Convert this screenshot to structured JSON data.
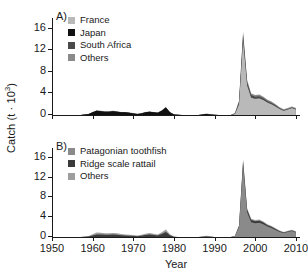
{
  "figure": {
    "xlabel": "Year",
    "ylabel_main": "Catch (t ",
    "ylabel_mid": "· 10",
    "ylabel_sup": "3",
    "ylabel_end": ")",
    "ylabel_full": "Catch (t · 10³)",
    "panel_a_letter": "A)",
    "panel_b_letter": "B)"
  },
  "colors": {
    "black": "#111111",
    "dark_gray": "#4a4a4a",
    "mid_gray": "#8a8a8a",
    "light_gray": "#b9b9b9",
    "axis": "#1a1a1a",
    "background": "#ffffff"
  },
  "panel_a": {
    "letter": "A)",
    "legend": [
      {
        "label": "France",
        "color": "#b9b9b9"
      },
      {
        "label": "Japan",
        "color": "#111111"
      },
      {
        "label": "South Africa",
        "color": "#4a4a4a"
      },
      {
        "label": "Others",
        "color": "#8a8a8a"
      }
    ],
    "yticks": [
      0,
      4,
      8,
      12,
      16
    ],
    "ylim": [
      0,
      18
    ]
  },
  "panel_b": {
    "letter": "B)",
    "legend": [
      {
        "label": "Patagonian toothfish",
        "color": "#8a8a8a"
      },
      {
        "label": "Ridge scale rattail",
        "color": "#3a3a3a"
      },
      {
        "label": "Others",
        "color": "#9e9e9e"
      }
    ],
    "yticks": [
      0,
      4,
      8,
      12,
      16
    ],
    "ylim": [
      0,
      18
    ]
  },
  "xaxis": {
    "ticks": [
      1950,
      1960,
      1970,
      1980,
      1990,
      2000,
      2010
    ],
    "xlim": [
      1950,
      2011
    ]
  },
  "chart_data": {
    "type": "area",
    "title": "",
    "xlabel": "Year",
    "ylabel": "Catch (t · 10³)",
    "xlim": [
      1950,
      2011
    ],
    "ylim": [
      0,
      18
    ],
    "grid": false,
    "panels": [
      {
        "panel": "A)",
        "legend_position": "top-left",
        "stacked": true,
        "x": [
          1950,
          1951,
          1952,
          1953,
          1954,
          1955,
          1956,
          1957,
          1958,
          1959,
          1960,
          1961,
          1962,
          1963,
          1964,
          1965,
          1966,
          1967,
          1968,
          1969,
          1970,
          1971,
          1972,
          1973,
          1974,
          1975,
          1976,
          1977,
          1978,
          1979,
          1980,
          1981,
          1982,
          1983,
          1984,
          1985,
          1986,
          1987,
          1988,
          1989,
          1990,
          1991,
          1992,
          1993,
          1994,
          1995,
          1996,
          1997,
          1998,
          1999,
          2000,
          2001,
          2002,
          2003,
          2004,
          2005,
          2006,
          2007,
          2008,
          2009,
          2010
        ],
        "series": [
          {
            "name": "France",
            "color": "#b9b9b9",
            "values": [
              0,
              0,
              0,
              0,
              0,
              0,
              0,
              0,
              0,
              0,
              0,
              0,
              0,
              0,
              0,
              0,
              0,
              0,
              0,
              0,
              0,
              0,
              0,
              0,
              0,
              0,
              0,
              0,
              0,
              0,
              0,
              0,
              0,
              0,
              0,
              0,
              0,
              0,
              0,
              0,
              0,
              0,
              0,
              0,
              0,
              0.2,
              2.0,
              14.0,
              5.5,
              3.2,
              3.0,
              3.1,
              2.8,
              2.3,
              2.0,
              1.6,
              1.1,
              0.8,
              1.0,
              1.3,
              1.0
            ]
          },
          {
            "name": "Japan",
            "color": "#111111",
            "values": [
              0,
              0,
              0,
              0,
              0,
              0,
              0,
              0,
              0.1,
              0.2,
              0.5,
              0.8,
              0.7,
              0.6,
              0.6,
              0.7,
              0.6,
              0.5,
              0.5,
              0.4,
              0.3,
              0.2,
              0.3,
              0.5,
              0.6,
              0.5,
              0.4,
              0.8,
              1.4,
              0.5,
              0.1,
              0.05,
              0,
              0,
              0,
              0,
              0,
              0.1,
              0.2,
              0.1,
              0.05,
              0,
              0,
              0,
              0,
              0,
              0,
              0,
              0,
              0,
              0,
              0,
              0,
              0,
              0,
              0,
              0,
              0,
              0,
              0,
              0
            ]
          },
          {
            "name": "South Africa",
            "color": "#4a4a4a",
            "values": [
              0,
              0,
              0,
              0,
              0,
              0,
              0,
              0,
              0,
              0,
              0,
              0,
              0,
              0,
              0,
              0,
              0,
              0,
              0,
              0,
              0,
              0,
              0,
              0,
              0,
              0,
              0,
              0,
              0,
              0,
              0,
              0,
              0,
              0,
              0,
              0,
              0,
              0,
              0,
              0,
              0,
              0,
              0,
              0,
              0,
              0.1,
              0.4,
              1.0,
              0.6,
              0.5,
              0.4,
              0.4,
              0.3,
              0.3,
              0.25,
              0.2,
              0.15,
              0.1,
              0.1,
              0.1,
              0.1
            ]
          },
          {
            "name": "Others",
            "color": "#8a8a8a",
            "values": [
              0,
              0,
              0,
              0,
              0,
              0,
              0,
              0,
              0,
              0,
              0.05,
              0.1,
              0.1,
              0.1,
              0.1,
              0.1,
              0.1,
              0.05,
              0.05,
              0.05,
              0.05,
              0.05,
              0.05,
              0.05,
              0.05,
              0.05,
              0.05,
              0.1,
              0.1,
              0.05,
              0.02,
              0,
              0,
              0,
              0,
              0,
              0,
              0.05,
              0.1,
              0.05,
              0,
              0,
              0,
              0,
              0,
              0.1,
              0.3,
              0.5,
              0.4,
              0.3,
              0.3,
              0.3,
              0.3,
              0.25,
              0.25,
              0.2,
              0.2,
              0.15,
              0.2,
              0.2,
              0.2
            ]
          }
        ],
        "peak": {
          "year": 1997,
          "value": 15.5
        }
      },
      {
        "panel": "B)",
        "legend_position": "top-left",
        "stacked": true,
        "x": [
          1950,
          1951,
          1952,
          1953,
          1954,
          1955,
          1956,
          1957,
          1958,
          1959,
          1960,
          1961,
          1962,
          1963,
          1964,
          1965,
          1966,
          1967,
          1968,
          1969,
          1970,
          1971,
          1972,
          1973,
          1974,
          1975,
          1976,
          1977,
          1978,
          1979,
          1980,
          1981,
          1982,
          1983,
          1984,
          1985,
          1986,
          1987,
          1988,
          1989,
          1990,
          1991,
          1992,
          1993,
          1994,
          1995,
          1996,
          1997,
          1998,
          1999,
          2000,
          2001,
          2002,
          2003,
          2004,
          2005,
          2006,
          2007,
          2008,
          2009,
          2010
        ],
        "series": [
          {
            "name": "Patagonian toothfish",
            "color": "#8a8a8a",
            "values": [
              0,
              0,
              0,
              0,
              0,
              0,
              0,
              0,
              0,
              0,
              0,
              0,
              0,
              0,
              0,
              0,
              0,
              0,
              0,
              0,
              0,
              0,
              0,
              0,
              0,
              0,
              0,
              0,
              0,
              0,
              0,
              0,
              0,
              0,
              0,
              0,
              0,
              0,
              0,
              0,
              0,
              0,
              0,
              0,
              0,
              0.2,
              2.0,
              14.5,
              5.0,
              3.0,
              2.8,
              2.9,
              2.6,
              2.1,
              1.8,
              1.4,
              1.0,
              0.8,
              1.0,
              1.2,
              0.9
            ]
          },
          {
            "name": "Ridge scale rattail",
            "color": "#3a3a3a",
            "values": [
              0,
              0,
              0,
              0,
              0,
              0,
              0,
              0,
              0.05,
              0.1,
              0.3,
              0.5,
              0.5,
              0.45,
              0.45,
              0.5,
              0.45,
              0.35,
              0.3,
              0.25,
              0.2,
              0.15,
              0.25,
              0.4,
              0.5,
              0.4,
              0.3,
              0.6,
              1.0,
              0.35,
              0.05,
              0,
              0,
              0,
              0,
              0,
              0,
              0.05,
              0.1,
              0.05,
              0,
              0,
              0,
              0,
              0,
              0,
              0.2,
              0.8,
              0.5,
              0.45,
              0.4,
              0.4,
              0.35,
              0.3,
              0.25,
              0.2,
              0.15,
              0.1,
              0.1,
              0.1,
              0.1
            ]
          },
          {
            "name": "Others",
            "color": "#9e9e9e",
            "values": [
              0,
              0,
              0,
              0,
              0,
              0,
              0,
              0,
              0.05,
              0.1,
              0.25,
              0.4,
              0.35,
              0.3,
              0.3,
              0.3,
              0.3,
              0.25,
              0.2,
              0.2,
              0.2,
              0.15,
              0.2,
              0.25,
              0.3,
              0.25,
              0.2,
              0.35,
              0.5,
              0.2,
              0.05,
              0,
              0,
              0,
              0,
              0,
              0,
              0.1,
              0.15,
              0.1,
              0,
              0,
              0,
              0,
              0,
              0.05,
              0.2,
              0.4,
              0.3,
              0.25,
              0.25,
              0.25,
              0.2,
              0.2,
              0.2,
              0.15,
              0.15,
              0.1,
              0.15,
              0.15,
              0.15
            ]
          }
        ],
        "peak": {
          "year": 1997,
          "value": 15.5
        }
      }
    ]
  }
}
